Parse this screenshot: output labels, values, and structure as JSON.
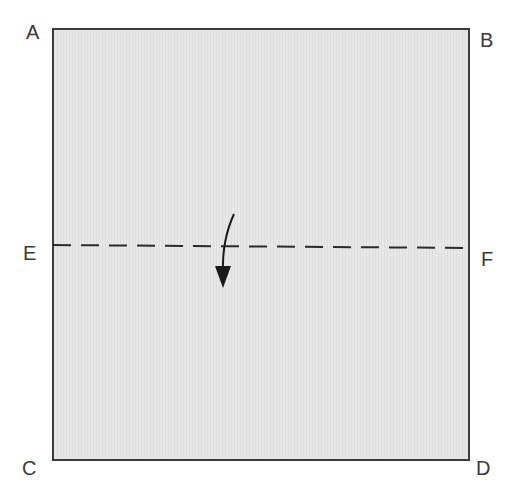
{
  "diagram": {
    "title": "",
    "square": {
      "fill": "#e6e6e6",
      "stroke": "#3a3a3a"
    },
    "corners": {
      "A": "A",
      "B": "B",
      "C": "C",
      "D": "D"
    },
    "midpoints": {
      "E": "E",
      "F": "F"
    },
    "fold_line": {
      "style": "dashed",
      "from": "E",
      "to": "F"
    },
    "fold_arrow": {
      "direction": "down"
    }
  }
}
